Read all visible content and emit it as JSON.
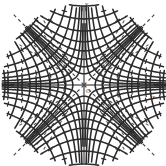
{
  "figure": {
    "kind": "orthogonal-hyperbolic-grid",
    "background_color": "#ffffff",
    "curve_color": "#2b2b2b",
    "axis_color": "#8c8c8c",
    "dashed_color": "#3a3a3a",
    "origin_label": "O",
    "axes": {
      "vertical": {
        "label": "y",
        "arrow": "up",
        "x_px": 84
      },
      "horizontal": {
        "label": "x",
        "arrow": "right",
        "y_px": 85
      }
    },
    "asymptotes": {
      "style": "dashed",
      "angles_deg": [
        45,
        135,
        225,
        315
      ]
    }
  },
  "chart_data": {
    "type": "line",
    "title": "",
    "subtitle": "",
    "xlabel": "x",
    "ylabel": "y",
    "legend_position": "none",
    "grid": false,
    "origin_label": "O",
    "xlim": [
      -8,
      8
    ],
    "ylim": [
      -8,
      8
    ],
    "center_px": [
      84,
      85
    ],
    "scale_px_per_unit": 10.2,
    "families": [
      {
        "name": "xy = k (solid hyperbolas)",
        "equation": "x*y = k",
        "style": "solid",
        "color": "#2b2b2b",
        "k_values": [
          0.6,
          1.6,
          3.2,
          5.6,
          9.0,
          14.0,
          21.0,
          30.0,
          -0.6,
          -1.6,
          -3.2,
          -5.6,
          -9.0,
          -14.0,
          -21.0,
          -30.0
        ]
      },
      {
        "name": "x^2 - y^2 = c (orthogonal hyperbolas)",
        "equation": "x^2 - y^2 = c",
        "style": "solid",
        "color": "#2b2b2b",
        "c_values": [
          1.2,
          3.2,
          6.4,
          11.2,
          18.0,
          28.0,
          42.0,
          60.0,
          -1.2,
          -3.2,
          -6.4,
          -11.2,
          -18.0,
          -28.0,
          -42.0,
          -60.0
        ]
      },
      {
        "name": "asymptotes y = ±x",
        "equation": "y = ±x",
        "style": "dashed",
        "color": "#3a3a3a",
        "slopes": [
          1,
          -1
        ]
      }
    ],
    "tick_marks": {
      "style": "short perpendicular dashes along each curve",
      "color": "#2b2b2b"
    }
  }
}
